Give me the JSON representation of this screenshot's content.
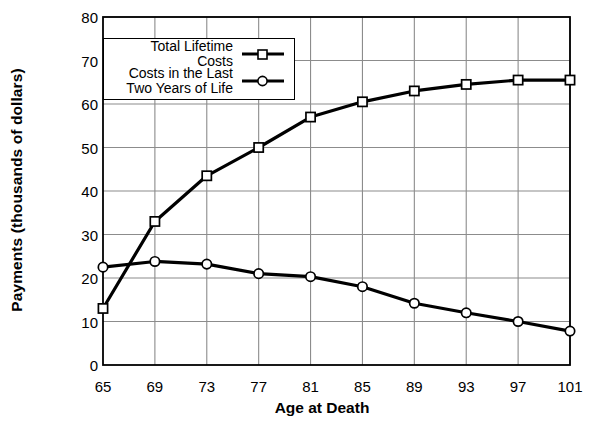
{
  "chart_data": {
    "type": "line",
    "title": "",
    "xlabel": "Age at Death",
    "ylabel": "Payments (thousands of dollars)",
    "x": [
      65,
      69,
      73,
      77,
      81,
      85,
      89,
      93,
      97,
      101
    ],
    "categories": [
      "65",
      "69",
      "73",
      "77",
      "81",
      "85",
      "89",
      "93",
      "97",
      "101"
    ],
    "xlim": [
      65,
      101
    ],
    "ylim": [
      0,
      80
    ],
    "yticks": [
      0,
      10,
      20,
      30,
      40,
      50,
      60,
      70,
      80
    ],
    "ytick_labels": [
      "0",
      "10",
      "20",
      "30",
      "40",
      "50",
      "60",
      "70",
      "80"
    ],
    "grid": true,
    "legend_position": "upper left",
    "series": [
      {
        "name": "Total Lifetime Costs",
        "marker": "square",
        "values": [
          13,
          33,
          43.5,
          50,
          57,
          60.5,
          63,
          64.5,
          65.5,
          65.5
        ]
      },
      {
        "name": "Costs in the Last\nTwo Years of Life",
        "marker": "circle",
        "values": [
          22.5,
          23.8,
          23.2,
          21,
          20.3,
          18,
          14.2,
          12,
          10,
          7.8
        ]
      }
    ],
    "colors": {
      "line": "#000000",
      "grid": "#8c8c8c",
      "axis": "#000000",
      "background": "#ffffff",
      "marker_fill": "#ffffff"
    }
  },
  "legend": {
    "items": [
      {
        "label": "Total Lifetime Costs",
        "marker": "square"
      },
      {
        "label": "Costs in the Last\nTwo Years of Life",
        "marker": "circle"
      }
    ]
  }
}
